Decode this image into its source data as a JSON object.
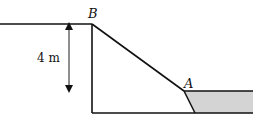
{
  "diagram": {
    "points": {
      "B": {
        "label": "B"
      },
      "A": {
        "label": "A"
      }
    },
    "dimension": {
      "label": "4 m",
      "direction": "vertical-double-arrow"
    },
    "shaded_region": {
      "fill": "#d4d4d4",
      "description": "water region to the right of point A"
    },
    "colors": {
      "line": "#111111",
      "fill": "#d4d4d4",
      "background": "#ffffff"
    }
  }
}
